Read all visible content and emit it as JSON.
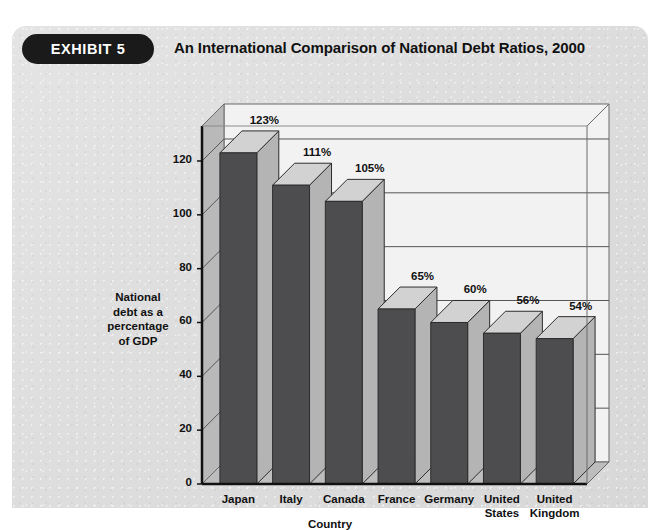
{
  "exhibit": {
    "badge_label": "EXHIBIT 5",
    "title": "An International Comparison of National Debt Ratios, 2000"
  },
  "chart_data": {
    "type": "bar",
    "title": "An International Comparison of National Debt Ratios, 2000",
    "xlabel": "Country",
    "ylabel": "National debt as a percentage of GDP",
    "ylabel_lines": [
      "National",
      "debt as a",
      "percentage",
      "of  GDP"
    ],
    "categories": [
      "Japan",
      "Italy",
      "Canada",
      "France",
      "Germany",
      "United States",
      "United Kingdom"
    ],
    "category_lines": [
      [
        "Japan"
      ],
      [
        "Italy"
      ],
      [
        "Canada"
      ],
      [
        "France"
      ],
      [
        "Germany"
      ],
      [
        "United",
        "States"
      ],
      [
        "United",
        "Kingdom"
      ]
    ],
    "values": [
      123,
      111,
      105,
      65,
      60,
      56,
      54
    ],
    "data_labels": [
      "123%",
      "111%",
      "105%",
      "65%",
      "60%",
      "56%",
      "54%"
    ],
    "yticks": [
      0,
      20,
      40,
      60,
      80,
      100,
      120
    ],
    "ytick_labels": [
      "0",
      "20",
      "40",
      "60",
      "80",
      "100",
      "120"
    ],
    "ylim": [
      0,
      133
    ],
    "grid": true,
    "legend": "none",
    "style": "3d-column",
    "colors": {
      "bar_front": "#4d4d50",
      "bar_top": "#d2d2d2",
      "bar_side": "#b4b4b4",
      "plot_background": "#f2f2f2",
      "wall_side": "#b9b9b9",
      "floor": "#bdbdbd",
      "gridline": "#555555",
      "axis": "#111111",
      "panel_background": "#dedede",
      "badge_background": "#1a1a1a",
      "badge_text": "#ffffff",
      "text": "#111111"
    }
  }
}
